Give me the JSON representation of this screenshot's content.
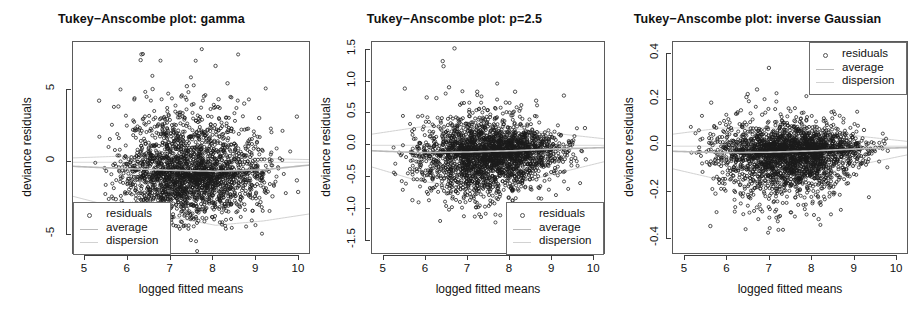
{
  "figure": {
    "background": "#ffffff",
    "point_color": "#1b1b1b",
    "average_color": "#b9b9b9",
    "dispersion_color": "#d2d2d2",
    "zero_line_color": "#d8d8d8",
    "box_color": "#5a5a5a"
  },
  "chart_data": [
    {
      "type": "scatter",
      "title": "Tukey−Anscombe plot: gamma",
      "xlabel": "logged fitted means",
      "ylabel": "deviance residuals",
      "xlim": [
        4.72,
        10.28
      ],
      "ylim": [
        -6.4,
        8.3
      ],
      "xticks": [
        5,
        6,
        7,
        8,
        9,
        10
      ],
      "xticklabels": [
        "5",
        "6",
        "7",
        "8",
        "9",
        "10"
      ],
      "yticks": [
        5,
        0,
        -5
      ],
      "yticklabels": [
        "5",
        "0",
        "-5"
      ],
      "grid": false,
      "legend": {
        "position": "bottom-left",
        "entries": [
          {
            "label": "residuals",
            "marker": "circle"
          },
          {
            "label": "average",
            "marker": "line"
          },
          {
            "label": "dispersion",
            "marker": "line"
          }
        ]
      },
      "n_points": 2300,
      "seed": 11,
      "spread_scale": 1.05,
      "spread_shape": [
        0.95,
        1.25,
        1.3,
        1.18,
        1.02,
        0.8
      ],
      "skew": 0.62,
      "upper_tail": 3.4,
      "lower_tail": 1.5,
      "average_curve": [
        -0.28,
        -0.42,
        -0.55,
        -0.62,
        -0.52,
        -0.18
      ],
      "dispersion_upper": [
        0.3,
        0.42,
        0.4,
        0.34,
        0.26,
        0.18
      ],
      "dispersion_lower": [
        -2.35,
        -3.2,
        -3.75,
        -4.35,
        -4.05,
        -3.55
      ],
      "zero_ref": 0.0,
      "outliers": [
        {
          "x": 6.32,
          "y": 7.45
        },
        {
          "x": 6.3,
          "y": 7.05
        },
        {
          "x": 8.05,
          "y": 6.65
        },
        {
          "x": 8.33,
          "y": 5.45
        },
        {
          "x": 7.38,
          "y": 5.25
        },
        {
          "x": 6.58,
          "y": 5.05
        },
        {
          "x": 7.78,
          "y": 4.55
        },
        {
          "x": 8.12,
          "y": 4.35
        },
        {
          "x": 8.72,
          "y": 4.05
        },
        {
          "x": 5.33,
          "y": 4.25
        },
        {
          "x": 5.78,
          "y": 3.85
        },
        {
          "x": 9.95,
          "y": 3.15
        },
        {
          "x": 9.07,
          "y": 3.05
        },
        {
          "x": 5.72,
          "y": -2.55
        },
        {
          "x": 8.3,
          "y": -3.35
        },
        {
          "x": 9.95,
          "y": -1.25
        },
        {
          "x": 9.98,
          "y": -2.05
        },
        {
          "x": 9.38,
          "y": -2.35
        },
        {
          "x": 9.1,
          "y": -2.75
        }
      ]
    },
    {
      "type": "scatter",
      "title": "Tukey−Anscombe plot: p=2.5",
      "xlabel": "logged fitted means",
      "ylabel": "deviance residuals",
      "xlim": [
        4.72,
        10.28
      ],
      "ylim": [
        -1.72,
        1.62
      ],
      "xticks": [
        5,
        6,
        7,
        8,
        9,
        10
      ],
      "xticklabels": [
        "5",
        "6",
        "7",
        "8",
        "9",
        "10"
      ],
      "yticks": [
        1.5,
        1.0,
        0.5,
        0.0,
        -0.5,
        -1.0,
        -1.5
      ],
      "yticklabels": [
        "1.5",
        "1.0",
        "0.5",
        "0.0",
        "-0.5",
        "-1.0",
        "-1.5"
      ],
      "grid": false,
      "legend": {
        "position": "bottom-right",
        "entries": [
          {
            "label": "residuals",
            "marker": "circle"
          },
          {
            "label": "average",
            "marker": "line"
          },
          {
            "label": "dispersion",
            "marker": "line"
          }
        ]
      },
      "n_points": 2600,
      "seed": 29,
      "spread_scale": 0.185,
      "spread_shape": [
        0.85,
        1.25,
        1.42,
        1.3,
        0.95,
        0.6
      ],
      "skew": 0.3,
      "upper_tail": 2.2,
      "lower_tail": 1.6,
      "average_curve": [
        -0.085,
        -0.115,
        -0.105,
        -0.085,
        -0.055,
        -0.035
      ],
      "dispersion_upper": [
        0.175,
        0.285,
        0.3,
        0.265,
        0.18,
        0.1
      ],
      "dispersion_lower": [
        -0.34,
        -0.56,
        -0.65,
        -0.61,
        -0.43,
        -0.25
      ],
      "zero_ref": 0.0,
      "outliers": [
        {
          "x": 6.68,
          "y": 1.52
        },
        {
          "x": 6.4,
          "y": 1.32
        },
        {
          "x": 6.42,
          "y": 1.24
        },
        {
          "x": 5.5,
          "y": 0.89
        },
        {
          "x": 6.55,
          "y": 0.91
        },
        {
          "x": 9.28,
          "y": 0.78
        },
        {
          "x": 7.22,
          "y": 0.84
        },
        {
          "x": 8.12,
          "y": 0.84
        },
        {
          "x": 6.02,
          "y": 0.75
        },
        {
          "x": 6.25,
          "y": 0.74
        },
        {
          "x": 7.9,
          "y": 0.67
        },
        {
          "x": 8.62,
          "y": 0.7
        },
        {
          "x": 9.78,
          "y": 0.27
        },
        {
          "x": 5.68,
          "y": -0.86
        },
        {
          "x": 6.98,
          "y": -0.78
        },
        {
          "x": 9.55,
          "y": -0.2
        },
        {
          "x": 9.8,
          "y": -0.22
        }
      ]
    },
    {
      "type": "scatter",
      "title": "Tukey−Anscombe plot: inverse Gaussian",
      "xlabel": "logged fitted means",
      "ylabel": "deviance residuals",
      "xlim": [
        4.72,
        10.28
      ],
      "ylim": [
        -0.47,
        0.45
      ],
      "xticks": [
        5,
        6,
        7,
        8,
        9,
        10
      ],
      "xticklabels": [
        "5",
        "6",
        "7",
        "8",
        "9",
        "10"
      ],
      "yticks": [
        0.4,
        0.2,
        0.0,
        -0.2,
        -0.4
      ],
      "yticklabels": [
        "0.4",
        "0.2",
        "0.0",
        "-0.2",
        "-0.4"
      ],
      "grid": false,
      "legend": {
        "position": "top-right",
        "entries": [
          {
            "label": "residuals",
            "marker": "circle"
          },
          {
            "label": "average",
            "marker": "line"
          },
          {
            "label": "dispersion",
            "marker": "line"
          }
        ]
      },
      "n_points": 2600,
      "seed": 47,
      "spread_scale": 0.052,
      "spread_shape": [
        1.05,
        1.3,
        1.35,
        1.2,
        0.8,
        0.45
      ],
      "skew": 0.28,
      "upper_tail": 2.0,
      "lower_tail": 1.7,
      "average_curve": [
        -0.022,
        -0.028,
        -0.026,
        -0.02,
        -0.011,
        -0.006
      ],
      "dispersion_upper": [
        0.052,
        0.078,
        0.08,
        0.068,
        0.042,
        0.02
      ],
      "dispersion_lower": [
        -0.098,
        -0.145,
        -0.152,
        -0.13,
        -0.078,
        -0.036
      ],
      "zero_ref": 0.0,
      "outliers": [
        {
          "x": 6.98,
          "y": 0.338
        },
        {
          "x": 6.7,
          "y": 0.245
        },
        {
          "x": 6.48,
          "y": 0.225
        },
        {
          "x": 6.45,
          "y": 0.212
        },
        {
          "x": 5.62,
          "y": 0.188
        },
        {
          "x": 6.32,
          "y": 0.155
        },
        {
          "x": 6.82,
          "y": 0.136
        },
        {
          "x": 7.58,
          "y": 0.11
        },
        {
          "x": 9.22,
          "y": 0.07
        },
        {
          "x": 9.68,
          "y": 0.022
        },
        {
          "x": 5.6,
          "y": -0.345
        },
        {
          "x": 8.15,
          "y": -0.315
        },
        {
          "x": 6.78,
          "y": -0.272
        },
        {
          "x": 5.72,
          "y": -0.205
        },
        {
          "x": 9.78,
          "y": -0.02
        }
      ]
    }
  ]
}
